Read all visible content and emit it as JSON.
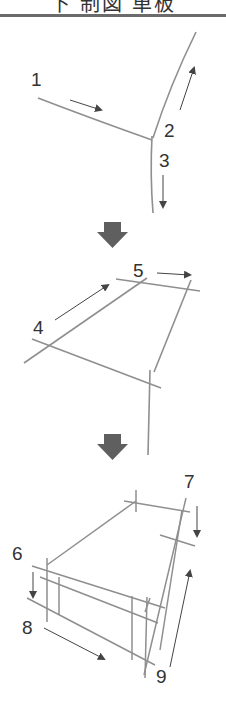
{
  "header": {
    "title": "下 制図 単板"
  },
  "steps": [
    {
      "label": "1"
    },
    {
      "label": "2"
    },
    {
      "label": "3"
    },
    {
      "label": "4"
    },
    {
      "label": "5"
    },
    {
      "label": "6"
    },
    {
      "label": "7"
    },
    {
      "label": "8"
    },
    {
      "label": "9"
    }
  ],
  "colors": {
    "stroke": "#8a8a8a",
    "arrow": "#555555",
    "text": "#333333",
    "block_arrow": "#5f5f5f"
  }
}
